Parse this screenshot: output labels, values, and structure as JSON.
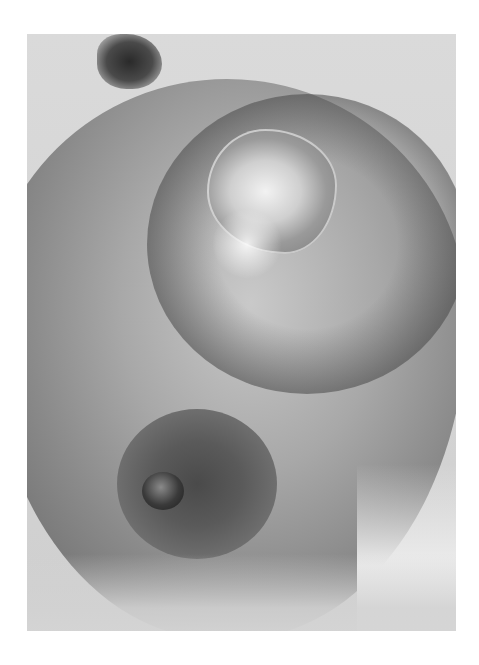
{
  "image": {
    "description": "Grayscale clinical photograph of a breast with a raised lesion in the upper area and the areola/nipple in the lower-left",
    "colors": {
      "page_background": "#ffffff",
      "skin_light": "#d8d8d8",
      "skin_mid": "#9a9a9a",
      "skin_dark": "#3c3c3c",
      "lesion_highlight": "#f2f2f2"
    },
    "regions": {
      "photo_frame": {
        "x": 27,
        "y": 34,
        "width": 429,
        "height": 597
      }
    }
  }
}
